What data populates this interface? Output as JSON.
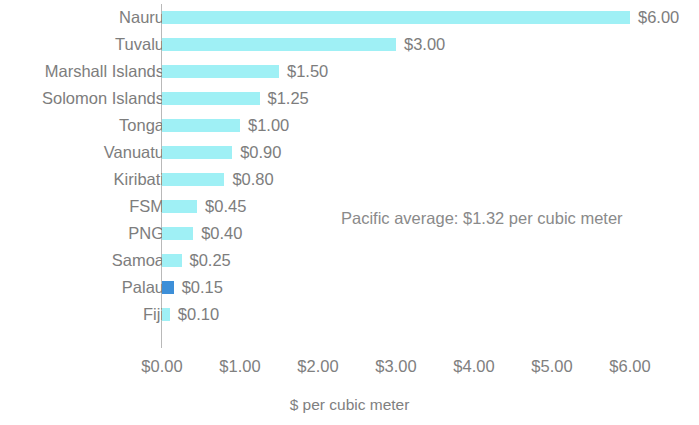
{
  "chart_data": {
    "type": "bar",
    "orientation": "horizontal",
    "title": "",
    "subtitle": "",
    "xlabel": "$ per cubic meter",
    "ylabel": "",
    "xlim": [
      0,
      6
    ],
    "xticks": [
      "$0.00",
      "$1.00",
      "$2.00",
      "$3.00",
      "$4.00",
      "$5.00",
      "$6.00"
    ],
    "xtick_values": [
      0,
      1,
      2,
      3,
      4,
      5,
      6
    ],
    "grid": false,
    "legend": "none",
    "categories": [
      "Nauru",
      "Tuvalu",
      "Marshall Islands",
      "Solomon Islands",
      "Tonga",
      "Vanuatu",
      "Kiribati",
      "FSM",
      "PNG",
      "Samoa",
      "Palau",
      "Fiji"
    ],
    "values": [
      6.0,
      3.0,
      1.5,
      1.25,
      1.0,
      0.9,
      0.8,
      0.45,
      0.4,
      0.25,
      0.15,
      0.1
    ],
    "value_labels": [
      "$6.00",
      "$3.00",
      "$1.50",
      "$1.25",
      "$1.00",
      "$0.90",
      "$0.80",
      "$0.45",
      "$0.40",
      "$0.25",
      "$0.15",
      "$0.10"
    ],
    "highlight_category": "Palau",
    "annotations": [
      "Pacific average: $1.32 per cubic meter"
    ],
    "colors": {
      "bar": "#9ff0f5",
      "bar_highlight": "#3d8fd8",
      "text": "#7d7d7d",
      "axis": "#b9b9b9",
      "background": "#ffffff"
    }
  }
}
